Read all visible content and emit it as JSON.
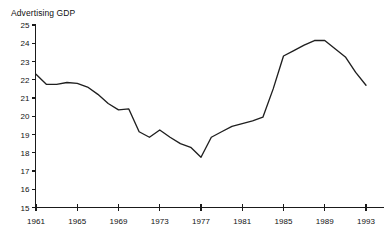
{
  "ghost_header": {
    "text": "—  ——  ———   ——  —"
  },
  "chart_data": {
    "type": "line",
    "title": "Advertising GDP",
    "subtitle": "",
    "xlabel": "",
    "ylabel": "",
    "xlim": [
      1961,
      1993
    ],
    "ylim": [
      15,
      25
    ],
    "grid": false,
    "legend": false,
    "legend_position": "none",
    "y_ticks": [
      15,
      16,
      17,
      18,
      19,
      20,
      21,
      22,
      23,
      24,
      25
    ],
    "y_tick_labels": [
      "15",
      "16",
      "17",
      "18",
      "19",
      "20",
      "21",
      "22",
      "23",
      "24",
      "25"
    ],
    "x_ticks": [
      1961,
      1965,
      1969,
      1973,
      1977,
      1981,
      1985,
      1989,
      1993
    ],
    "x_tick_labels": [
      "1961",
      "1965",
      "1969",
      "1973",
      "1977",
      "1981",
      "1985",
      "1989",
      "1993"
    ],
    "x_minor_ticks": [
      1962,
      1963,
      1964,
      1966,
      1967,
      1968,
      1970,
      1971,
      1972,
      1974,
      1975,
      1976,
      1978,
      1979,
      1980,
      1982,
      1983,
      1984,
      1986,
      1987,
      1988,
      1990,
      1991,
      1992
    ],
    "line_color": "#1f1f1f",
    "axis_color": "#1a1a1a",
    "background_color": "#ffffff",
    "x": [
      1961,
      1962,
      1963,
      1964,
      1965,
      1966,
      1967,
      1968,
      1969,
      1970,
      1971,
      1972,
      1973,
      1974,
      1975,
      1976,
      1977,
      1978,
      1979,
      1980,
      1981,
      1982,
      1983,
      1984,
      1985,
      1986,
      1987,
      1988,
      1989,
      1990,
      1991,
      1992,
      1993
    ],
    "values": [
      22.3,
      21.75,
      21.75,
      21.85,
      21.8,
      21.6,
      21.2,
      20.7,
      20.35,
      20.4,
      19.15,
      18.85,
      19.25,
      18.85,
      18.5,
      18.3,
      17.75,
      18.85,
      19.15,
      19.45,
      19.6,
      19.75,
      19.95,
      21.5,
      23.3,
      23.6,
      23.9,
      24.15,
      24.15,
      23.7,
      23.25,
      22.4,
      21.7
    ],
    "series": [
      {
        "name": "Advertising GDP",
        "values": [
          22.3,
          21.75,
          21.75,
          21.85,
          21.8,
          21.6,
          21.2,
          20.7,
          20.35,
          20.4,
          19.15,
          18.85,
          19.25,
          18.85,
          18.5,
          18.3,
          17.75,
          18.85,
          19.15,
          19.45,
          19.6,
          19.75,
          19.95,
          21.5,
          23.3,
          23.6,
          23.9,
          24.15,
          24.15,
          23.7,
          23.25,
          22.4,
          21.7
        ]
      }
    ],
    "annotations": []
  }
}
